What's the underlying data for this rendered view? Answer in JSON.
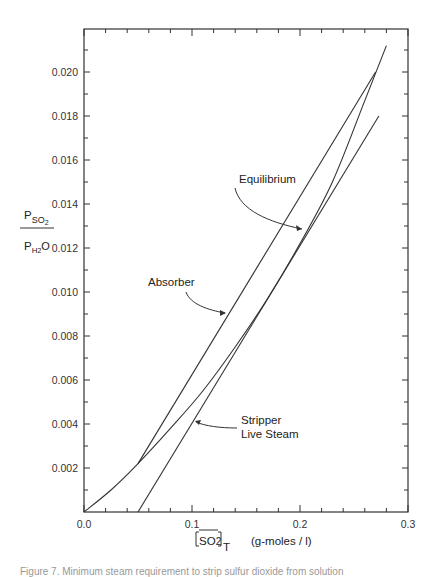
{
  "chart_data": {
    "type": "line",
    "title": "",
    "xlabel": "[SO2]T (g-moles/l)",
    "ylabel": "P_SO2 / P_H2O",
    "xlim": [
      0.0,
      0.3
    ],
    "ylim": [
      0.0,
      0.022
    ],
    "grid": false,
    "legend": "none (curves labeled by annotations)",
    "x_ticks": [
      "0.0",
      "0.1",
      "0.2",
      "0.3"
    ],
    "y_ticks": [
      "0.002",
      "0.004",
      "0.006",
      "0.008",
      "0.010",
      "0.012",
      "0.014",
      "0.016",
      "0.018",
      "0.020"
    ],
    "series": [
      {
        "name": "Equilibrium",
        "x": [
          0.0,
          0.025,
          0.05,
          0.08,
          0.11,
          0.14,
          0.17,
          0.2,
          0.23,
          0.26,
          0.28
        ],
        "y": [
          0.0,
          0.001,
          0.0022,
          0.0038,
          0.0055,
          0.0075,
          0.0097,
          0.0122,
          0.015,
          0.0187,
          0.0212
        ]
      },
      {
        "name": "Absorber",
        "x": [
          0.05,
          0.27
        ],
        "y": [
          0.0022,
          0.02
        ]
      },
      {
        "name": "Stripper Live Steam",
        "x": [
          0.05,
          0.273
        ],
        "y": [
          0.0,
          0.018
        ]
      }
    ],
    "annotations": [
      "Equilibrium",
      "Absorber",
      "Stripper",
      "Live Steam"
    ]
  },
  "labels": {
    "y_num": "P",
    "y_num_sub": "SO",
    "y_num_sub2": "2",
    "y_den": "P",
    "y_den_sub": "H",
    "y_den_sub2": "2",
    "y_den_tail": "O",
    "x_main": "SO",
    "x_sub2": "2",
    "x_subT": "T",
    "x_units": "(g-moles / l)",
    "equilibrium": "Equilibrium",
    "absorber": "Absorber",
    "stripper": "Stripper",
    "live_steam": "Live Steam"
  },
  "caption": "Figure 7.  Minimum steam requirement to strip sulfur dioxide from solution"
}
